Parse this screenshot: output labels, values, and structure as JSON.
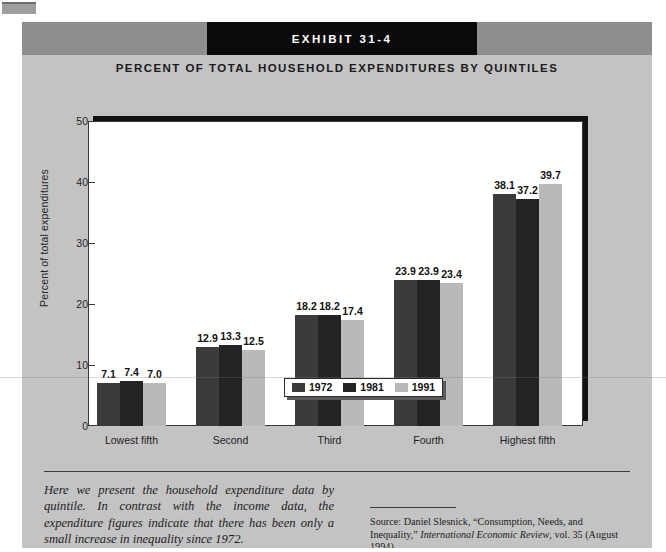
{
  "exhibit": {
    "banner_label": "EXHIBIT 31-4",
    "title": "PERCENT OF TOTAL HOUSEHOLD EXPENDITURES BY QUINTILES"
  },
  "caption": "Here we present the household expenditure data by quintile. In contrast with the income data, the expenditure figures indicate that there has been only a small increase in inequality since 1972.",
  "source": {
    "prefix": "Source: Daniel Slesnick, “Consumption, Needs, and Inequality,” ",
    "journal": "International Economic Review",
    "suffix": ", vol. 35 (August 1994)."
  },
  "colors": {
    "panel": "#c3c3c3",
    "header_band": "#8e8e8e",
    "banner": "#0b0b0b",
    "series_1972": "#3b3b3b",
    "series_1981": "#232323",
    "series_1991": "#b9b9b9"
  },
  "chart_data": {
    "type": "bar",
    "title": "PERCENT OF TOTAL HOUSEHOLD EXPENDITURES BY QUINTILES",
    "xlabel": "",
    "ylabel": "Percent of total expenditures",
    "ylim": [
      0,
      50
    ],
    "yticks": [
      0,
      10,
      20,
      30,
      40,
      50
    ],
    "grid": false,
    "legend_position": "bottom",
    "categories": [
      "Lowest fifth",
      "Second",
      "Third",
      "Fourth",
      "Highest fifth"
    ],
    "series": [
      {
        "name": "1972",
        "color": "#3b3b3b",
        "values": [
          7.1,
          12.9,
          18.2,
          23.9,
          38.1
        ]
      },
      {
        "name": "1981",
        "color": "#232323",
        "values": [
          7.4,
          13.3,
          18.2,
          23.9,
          37.2
        ]
      },
      {
        "name": "1991",
        "color": "#b9b9b9",
        "values": [
          7.0,
          12.5,
          17.4,
          23.4,
          39.7
        ]
      }
    ]
  }
}
